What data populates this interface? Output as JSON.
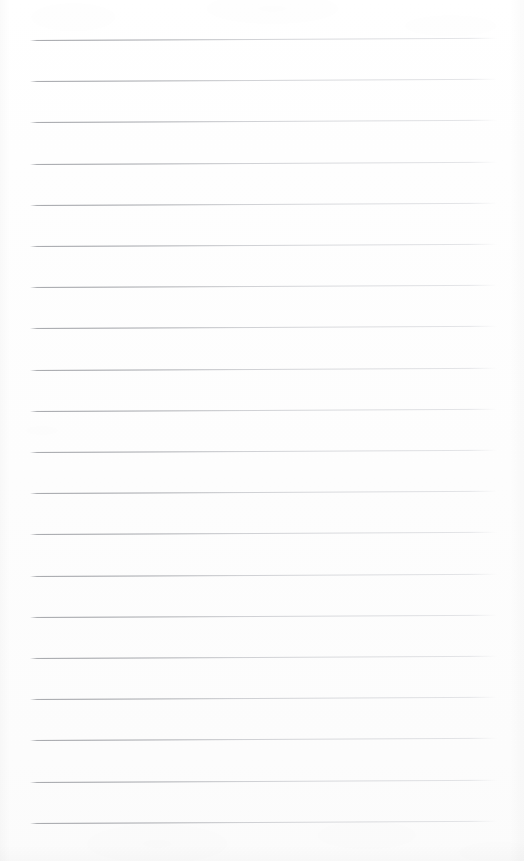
{
  "document": {
    "kind": "blank-ruled-notebook-page",
    "title": "Blank Ruled Notebook Page",
    "text_content": "",
    "has_text": false,
    "has_margin_rule": false,
    "has_punch_holes": false,
    "has_header": false,
    "has_page_number": false
  },
  "page": {
    "width": 524,
    "height": 861,
    "background_color": "#fefefe",
    "paper_tone": "#fdfdfd"
  },
  "rules": {
    "count": 20,
    "color": "#c8c9cc",
    "ink_color_dark": "#96989d",
    "thickness_px": 1,
    "left_x": 30,
    "right_x": 497,
    "length_px": 467,
    "first_line_y": 40,
    "spacing_px": 41.2,
    "last_line_y": 823,
    "slope_deg": -0.28,
    "positions_y": [
      40,
      81.2,
      122.4,
      163.6,
      204.8,
      246,
      287.2,
      328.4,
      369.6,
      410.8,
      452,
      493.2,
      534.4,
      575.6,
      616.8,
      658,
      699.2,
      740.4,
      781.6,
      822.8
    ]
  }
}
